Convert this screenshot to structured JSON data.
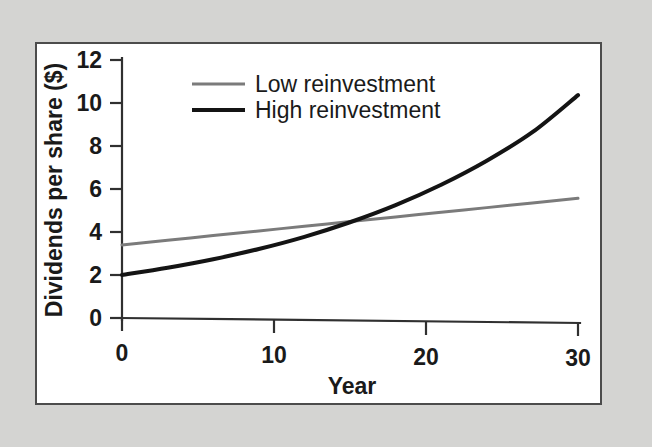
{
  "figure": {
    "background_color": "#d4d4d2",
    "panel_color": "#ffffff",
    "panel_border_color": "#4c4c4c"
  },
  "chart_data": {
    "type": "line",
    "title": "",
    "subtitle": "",
    "xlabel": "Year",
    "ylabel": "Dividends per share ($)",
    "xlim": [
      0,
      30
    ],
    "ylim": [
      0,
      12
    ],
    "xticks": [
      0,
      10,
      20,
      30
    ],
    "xtick_labels": [
      "0",
      "10",
      "20",
      "30"
    ],
    "yticks": [
      0,
      2,
      4,
      6,
      8,
      10,
      12
    ],
    "ytick_labels": [
      "0",
      "2",
      "4",
      "6",
      "8",
      "10",
      "12"
    ],
    "grid": false,
    "legend_position": "upper-left-inside",
    "x": [
      0,
      3,
      6,
      9,
      12,
      15,
      18,
      21,
      24,
      27,
      30
    ],
    "series": [
      {
        "name": "Low reinvestment",
        "color": "#7b7b7b",
        "line_width": 3.0,
        "values": [
          3.4,
          3.64,
          3.88,
          4.12,
          4.36,
          4.6,
          4.84,
          5.08,
          5.32,
          5.56,
          5.8
        ]
      },
      {
        "name": "High reinvestment",
        "color": "#141414",
        "line_width": 4.0,
        "values": [
          2.0,
          2.36,
          2.78,
          3.28,
          3.87,
          4.57,
          5.39,
          6.36,
          7.5,
          8.85,
          10.6
        ]
      }
    ],
    "annotations": [
      {
        "text": "crossover",
        "x": 13,
        "y": 4.4,
        "visible": false
      }
    ]
  },
  "legend": {
    "entries": [
      {
        "label": "Low reinvestment",
        "color": "#7b7b7b",
        "line_width": 3.0
      },
      {
        "label": "High reinvestment",
        "color": "#141414",
        "line_width": 4.0
      }
    ]
  },
  "axes": {
    "x_title": "Year",
    "y_title": "Dividends per share ($)"
  }
}
